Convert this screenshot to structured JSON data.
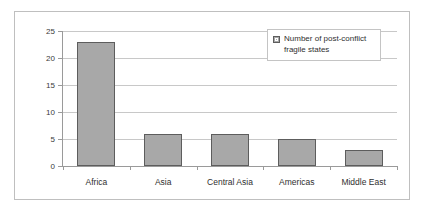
{
  "chart_data": {
    "type": "bar",
    "title": "",
    "xlabel": "",
    "ylabel": "",
    "categories": [
      "Africa",
      "Asia",
      "Central Asia",
      "Americas",
      "Middle East"
    ],
    "values": [
      23,
      6,
      6,
      5,
      3
    ],
    "series": [
      {
        "name": "Number of post-conflict fragile states",
        "values": [
          23,
          6,
          6,
          5,
          3
        ]
      }
    ],
    "ylim": [
      0,
      25
    ],
    "ytick_labels": [
      "0",
      "5",
      "10",
      "15",
      "20",
      "25"
    ],
    "ytick_values": [
      0,
      5,
      10,
      15,
      20,
      25
    ],
    "grid": "horizontal",
    "legend_position": "upper-right",
    "legend_entries": [
      {
        "label_line1": "Number of post-conflict",
        "label_line2": "fragile states",
        "swatch_color": "#a8a8a8"
      }
    ]
  },
  "style": {
    "bar_fill": "#a8a8a8",
    "bar_border": "#5d5d5d",
    "gridline_color": "#c8c8c8",
    "axis_color": "#9a9a9a",
    "frame_border": "#bfbfbf",
    "background": "#ffffff",
    "text_color": "#2f2f2f"
  }
}
